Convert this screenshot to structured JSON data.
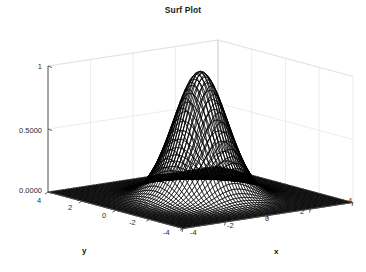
{
  "figure": {
    "title": "Surf Plot",
    "width": 366,
    "height": 272,
    "background": "#ffffff",
    "mesh_color": "#000000",
    "axis_color": "#4d4d4d",
    "grid_color": "#e2e2e2",
    "text_color": "#2b2b2b"
  },
  "axes": {
    "x": {
      "label": "x",
      "ticks": [
        -4,
        -2,
        0,
        2,
        4
      ],
      "tick_labels": [
        "-4",
        "-2",
        "0",
        "2",
        "4"
      ],
      "range": [
        -4,
        4
      ]
    },
    "y": {
      "label": "y",
      "ticks": [
        -4,
        -2,
        0,
        2,
        4
      ],
      "tick_labels": [
        "4",
        "2",
        "0",
        "-2",
        "-4"
      ],
      "tick_values_display_order": [
        4,
        2,
        0,
        -2,
        -4
      ],
      "range": [
        -4,
        4
      ]
    },
    "z": {
      "label": "",
      "ticks": [
        0,
        0.5,
        1
      ],
      "tick_labels": [
        "0.0000",
        "0.5000",
        "1"
      ],
      "range": [
        0,
        1
      ]
    }
  },
  "chart_data": {
    "type": "surface",
    "title": "Surf Plot",
    "xlabel": "x",
    "ylabel": "y",
    "zlabel": "",
    "grid": true,
    "legend": false,
    "colormap": "mesh-black-on-white",
    "function": "z = exp(-(x^2 + y^2)/2)",
    "x": [
      -4,
      -3.75,
      -3.5,
      -3.25,
      -3,
      -2.75,
      -2.5,
      -2.25,
      -2,
      -1.75,
      -1.5,
      -1.25,
      -1,
      -0.75,
      -0.5,
      -0.25,
      0,
      0.25,
      0.5,
      0.75,
      1,
      1.25,
      1.5,
      1.75,
      2,
      2.25,
      2.5,
      2.75,
      3,
      3.25,
      3.5,
      3.75,
      4
    ],
    "y": [
      -4,
      -3.75,
      -3.5,
      -3.25,
      -3,
      -2.75,
      -2.5,
      -2.25,
      -2,
      -1.75,
      -1.5,
      -1.25,
      -1,
      -0.75,
      -0.5,
      -0.25,
      0,
      0.25,
      0.5,
      0.75,
      1,
      1.25,
      1.5,
      1.75,
      2,
      2.25,
      2.5,
      2.75,
      3,
      3.25,
      3.5,
      3.75,
      4
    ],
    "xlim": [
      -4,
      4
    ],
    "ylim": [
      -4,
      4
    ],
    "zlim": [
      0,
      1
    ],
    "zmax": 1,
    "zmin": 0,
    "peak": {
      "x": 0,
      "y": 0,
      "z": 1
    },
    "z_profile_along_y0": [
      0.000335,
      0.000873,
      0.002187,
      0.00526,
      0.011109,
      0.022699,
      0.043937,
      0.07956,
      0.135335,
      0.216265,
      0.324652,
      0.457833,
      0.606531,
      0.75484,
      0.882497,
      0.969233,
      1.0,
      0.969233,
      0.882497,
      0.75484,
      0.606531,
      0.457833,
      0.324652,
      0.216265,
      0.135335,
      0.07956,
      0.043937,
      0.022699,
      0.011109,
      0.00526,
      0.002187,
      0.000873,
      0.000335
    ],
    "view": {
      "azimuth": -37.5,
      "elevation": 30
    }
  }
}
